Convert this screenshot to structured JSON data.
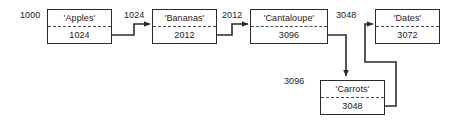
{
  "diagram": {
    "type": "linked-list-memory-diagram",
    "background_color": "#ffffff",
    "line_color": "#2b2b2b",
    "text_color": "#1a1a1a",
    "nodes": [
      {
        "id": "apples",
        "name": "'Apples'",
        "value": "1024",
        "address_label": "1000",
        "x": 47,
        "y": 9,
        "w": 65,
        "h": 35
      },
      {
        "id": "bananas",
        "name": "'Bananas'",
        "value": "2012",
        "address_label": "1024",
        "x": 152,
        "y": 9,
        "w": 65,
        "h": 35
      },
      {
        "id": "cantaloupe",
        "name": "'Cantaloupe'",
        "value": "3096",
        "address_label": "2012",
        "x": 250,
        "y": 9,
        "w": 78,
        "h": 35
      },
      {
        "id": "dates",
        "name": "'Dates'",
        "value": "3072",
        "address_label": "3048",
        "x": 375,
        "y": 9,
        "w": 65,
        "h": 35
      },
      {
        "id": "carrots",
        "name": "'Carrots'",
        "value": "3048",
        "address_label": "3096",
        "x": 320,
        "y": 80,
        "w": 65,
        "h": 35
      }
    ],
    "address_labels": [
      {
        "id": "addr-apples",
        "text": "1000",
        "x": 20,
        "y": 10
      },
      {
        "id": "addr-bananas",
        "text": "1024",
        "x": 124,
        "y": 10
      },
      {
        "id": "addr-cantaloupe",
        "text": "2012",
        "x": 222,
        "y": 10
      },
      {
        "id": "addr-dates",
        "text": "3048",
        "x": 336,
        "y": 10
      },
      {
        "id": "addr-carrots",
        "text": "3096",
        "x": 284,
        "y": 76
      }
    ],
    "connections": [
      {
        "id": "apples-to-bananas",
        "from": "apples",
        "to": "bananas"
      },
      {
        "id": "bananas-to-cantaloupe",
        "from": "bananas",
        "to": "cantaloupe"
      },
      {
        "id": "cantaloupe-to-carrots",
        "from": "cantaloupe",
        "to": "carrots"
      },
      {
        "id": "carrots-to-dates",
        "from": "carrots",
        "to": "dates"
      }
    ]
  }
}
